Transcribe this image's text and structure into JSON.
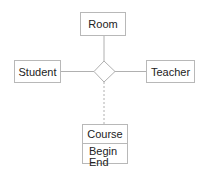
{
  "diagram": {
    "type": "ER ternary relationship",
    "entities": [
      {
        "id": "room",
        "label": "Room"
      },
      {
        "id": "student",
        "label": "Student"
      },
      {
        "id": "teacher",
        "label": "Teacher"
      },
      {
        "id": "course",
        "label": "Course",
        "attributes": [
          "Begin",
          "End"
        ]
      }
    ],
    "relationship": {
      "shape": "diamond",
      "label": ""
    },
    "connections": [
      {
        "from": "relationship",
        "to": "room",
        "style": "solid"
      },
      {
        "from": "relationship",
        "to": "student",
        "style": "solid"
      },
      {
        "from": "relationship",
        "to": "teacher",
        "style": "solid"
      },
      {
        "from": "relationship",
        "to": "course",
        "style": "dashed"
      }
    ],
    "colors": {
      "stroke": "#b8b8b8",
      "text": "#222222",
      "background": "#ffffff"
    }
  }
}
